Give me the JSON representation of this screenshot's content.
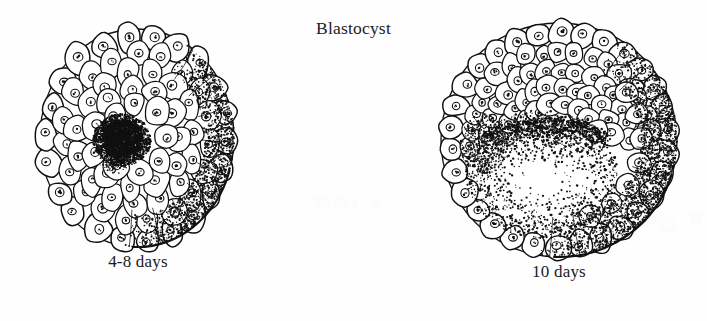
{
  "page": {
    "title": "Blastocyst",
    "background_color": "#fefefe",
    "ink_color": "#111111",
    "width": 707,
    "height": 321
  },
  "figures": [
    {
      "id": "blastocyst-4-8-days",
      "label": "4-8 days",
      "stage": "early blastocyst",
      "description": "Spherical morula/early blastocyst shown in cut section with an outer layer of rounded nucleated cells surrounding a dense stippled inner cell mass at the centre.",
      "cx": 137,
      "cy": 138,
      "rx": 98,
      "ry": 110,
      "inner_mass": {
        "cx": 122,
        "cy": 140,
        "rx": 30,
        "ry": 27,
        "density": "dense"
      },
      "cell_rings": [
        22,
        18,
        14,
        10,
        6
      ],
      "shading": "stippled right and lower-right surface"
    },
    {
      "id": "blastocyst-10-days",
      "label": "10 days",
      "stage": "late blastocyst",
      "description": "Larger blastocyst in cut section with a single layer of trophoblast cells, a thick inner cell mass of cells at the upper pole, and a large stippled blastocoel cavity below.",
      "cx": 559,
      "cy": 140,
      "rx": 119,
      "ry": 118,
      "cavity": {
        "cx": 545,
        "cy": 172,
        "rx": 78,
        "ry": 66,
        "density": "graded"
      },
      "cell_rings": [
        26,
        20,
        15,
        10
      ],
      "shading": "stippled right and lower-right surface"
    }
  ],
  "ghost_marks": [
    {
      "x": 314,
      "y": 195,
      "w": 16,
      "h": 12
    },
    {
      "x": 333,
      "y": 196,
      "w": 14,
      "h": 13
    },
    {
      "x": 352,
      "y": 198,
      "w": 6,
      "h": 12
    },
    {
      "x": 372,
      "y": 196,
      "w": 8,
      "h": 10
    },
    {
      "x": 648,
      "y": 215,
      "w": 26,
      "h": 9
    },
    {
      "x": 690,
      "y": 212,
      "w": 12,
      "h": 12
    },
    {
      "x": 660,
      "y": 226,
      "w": 16,
      "h": 7
    }
  ]
}
